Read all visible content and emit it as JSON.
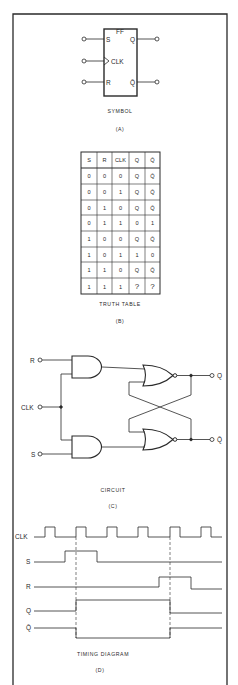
{
  "panels": {
    "symbol": {
      "caption": "SYMBOL",
      "letter": "(A)",
      "box_label": "FF",
      "inputs": [
        "S",
        "CLK",
        "R"
      ],
      "outputs": [
        "Q",
        "Q̄"
      ]
    },
    "truth_table": {
      "caption": "TRUTH TABLE",
      "letter": "(B)",
      "headers": [
        "S",
        "R",
        "CLK",
        "Q",
        "Q̄"
      ],
      "rows": [
        [
          "0",
          "0",
          "0",
          "Q",
          "Q̄"
        ],
        [
          "0",
          "0",
          "1",
          "Q",
          "Q̄"
        ],
        [
          "0",
          "1",
          "0",
          "Q",
          "Q̄"
        ],
        [
          "0",
          "1",
          "1",
          "0",
          "1"
        ],
        [
          "1",
          "0",
          "0",
          "Q",
          "Q̄"
        ],
        [
          "1",
          "0",
          "1",
          "1",
          "0"
        ],
        [
          "1",
          "1",
          "0",
          "Q",
          "Q̄"
        ],
        [
          "1",
          "1",
          "1",
          "?",
          "?"
        ]
      ]
    },
    "circuit": {
      "caption": "CIRCUIT",
      "letter": "(C)",
      "inputs": [
        "R",
        "CLK",
        "S"
      ],
      "outputs": [
        "Q",
        "Q̄"
      ],
      "gates": [
        "AND",
        "AND",
        "NOR",
        "NOR"
      ]
    },
    "timing": {
      "caption": "TIMING DIAGRAM",
      "letter": "(D)",
      "signals": [
        "CLK",
        "S",
        "R",
        "Q",
        "Q̄"
      ]
    }
  },
  "colors": {
    "ink": "#2a2a2a",
    "background": "#ffffff"
  }
}
